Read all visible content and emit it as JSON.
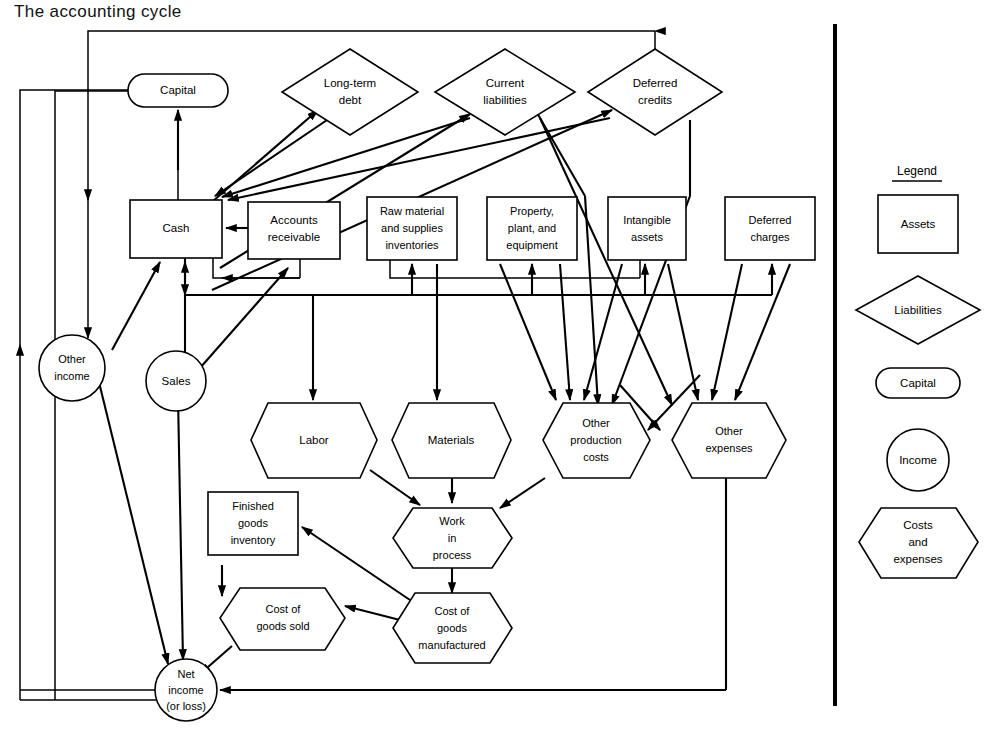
{
  "page": {
    "title": "The accounting cycle"
  },
  "legend": {
    "heading": "Legend",
    "items": [
      {
        "shape": "rectangle",
        "label": "Assets"
      },
      {
        "shape": "diamond",
        "label": "Liabilities"
      },
      {
        "shape": "stadium",
        "label": "Capital"
      },
      {
        "shape": "circle",
        "label": "Income"
      },
      {
        "shape": "hexagon",
        "label": "Costs\nand\nexpenses"
      }
    ]
  },
  "nodes": {
    "capital": {
      "label": "Capital",
      "shape": "stadium",
      "category": "capital"
    },
    "long_term_debt": {
      "label_line1": "Long-term",
      "label_line2": "debt",
      "shape": "diamond",
      "category": "liabilities"
    },
    "current_liabilities": {
      "label_line1": "Current",
      "label_line2": "liabilities",
      "shape": "diamond",
      "category": "liabilities"
    },
    "deferred_credits": {
      "label_line1": "Deferred",
      "label_line2": "credits",
      "shape": "diamond",
      "category": "liabilities"
    },
    "cash": {
      "label": "Cash",
      "shape": "rectangle",
      "category": "assets"
    },
    "accounts_receivable": {
      "label_line1": "Accounts",
      "label_line2": "receivable",
      "shape": "rectangle",
      "category": "assets"
    },
    "raw_material": {
      "label_line1": "Raw material",
      "label_line2": "and supplies",
      "label_line3": "inventories",
      "shape": "rectangle",
      "category": "assets"
    },
    "property_plant": {
      "label_line1": "Property,",
      "label_line2": "plant, and",
      "label_line3": "equipment",
      "shape": "rectangle",
      "category": "assets"
    },
    "intangible_assets": {
      "label_line1": "Intangible",
      "label_line2": "assets",
      "shape": "rectangle",
      "category": "assets"
    },
    "deferred_charges": {
      "label_line1": "Deferred",
      "label_line2": "charges",
      "shape": "rectangle",
      "category": "assets"
    },
    "other_income": {
      "label_line1": "Other",
      "label_line2": "income",
      "shape": "circle",
      "category": "income"
    },
    "sales": {
      "label": "Sales",
      "shape": "circle",
      "category": "income"
    },
    "labor": {
      "label": "Labor",
      "shape": "hexagon",
      "category": "costs"
    },
    "materials": {
      "label": "Materials",
      "shape": "hexagon",
      "category": "costs"
    },
    "other_production_costs": {
      "label_line1": "Other",
      "label_line2": "production",
      "label_line3": "costs",
      "shape": "hexagon",
      "category": "costs"
    },
    "other_expenses": {
      "label_line1": "Other",
      "label_line2": "expenses",
      "shape": "hexagon",
      "category": "costs"
    },
    "finished_goods_inventory": {
      "label_line1": "Finished",
      "label_line2": "goods",
      "label_line3": "inventory",
      "shape": "rectangle",
      "category": "assets"
    },
    "work_in_process": {
      "label_line1": "Work",
      "label_line2": "in",
      "label_line3": "process",
      "shape": "hexagon",
      "category": "costs"
    },
    "cost_of_goods_sold": {
      "label_line1": "Cost of",
      "label_line2": "goods sold",
      "shape": "hexagon",
      "category": "costs"
    },
    "cost_of_goods_manufactured": {
      "label_line1": "Cost of",
      "label_line2": "goods",
      "label_line3": "manufactured",
      "shape": "hexagon",
      "category": "costs"
    },
    "net_income": {
      "label_line1": "Net",
      "label_line2": "income",
      "label_line3": "(or loss)",
      "shape": "circle",
      "category": "income"
    }
  },
  "colors": {
    "stroke": "#000000",
    "background": "#ffffff"
  }
}
